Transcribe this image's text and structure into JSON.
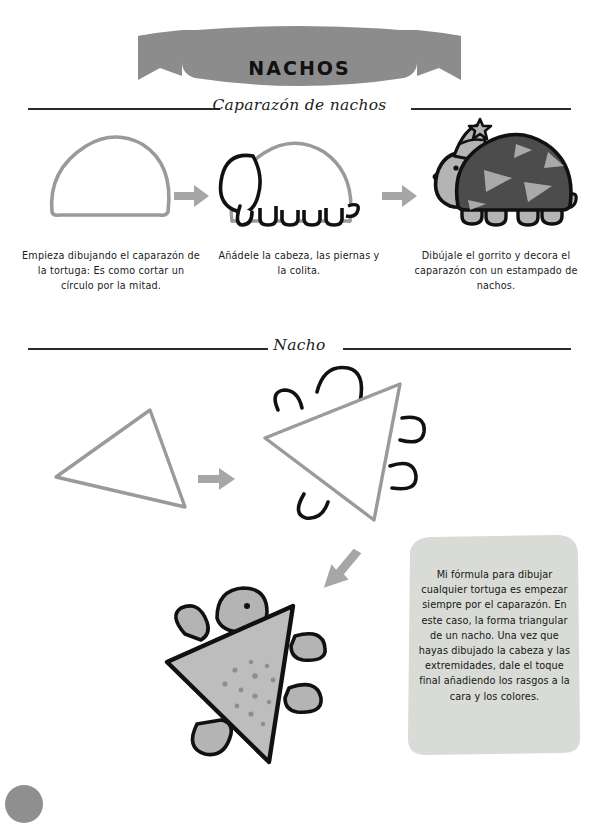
{
  "page": {
    "background_color": "#ffffff",
    "banner": {
      "title": "NACHOS",
      "fill_color": "#8c8c8c"
    },
    "corner_decoration": {
      "name": "page-corner-circle",
      "color": "#8f8f8f"
    }
  },
  "sections": [
    {
      "id": "caparazon",
      "title": "Caparazón de nachos",
      "steps": [
        {
          "index": 1,
          "caption": "Empieza dibujando el caparazón de la tortuga: Es como cortar un círculo por la mitad.",
          "figure": "turtle-shell-dome"
        },
        {
          "index": 2,
          "caption": "Añádele la cabeza, las piernas y la colita.",
          "figure": "turtle-outline-with-head-legs-tail"
        },
        {
          "index": 3,
          "caption": "Dibújale el gorrito y decora el caparazón con un estampado de nachos.",
          "figure": "turtle-colored-with-party-hat"
        }
      ]
    },
    {
      "id": "nacho",
      "title": "Nacho",
      "steps": [
        {
          "index": 1,
          "caption": "",
          "figure": "nacho-triangle-outline"
        },
        {
          "index": 2,
          "caption": "",
          "figure": "nacho-triangle-with-limbs"
        },
        {
          "index": 3,
          "caption": "",
          "figure": "nacho-turtle-colored"
        }
      ]
    }
  ],
  "note": {
    "text": "Mi fórmula para dibujar cualquier tortuga es empezar siempre por el caparazón. En este caso, la forma triangular de un nacho. Una vez que hayas dibujado la cabeza y las extremidades, dale el toque final añadiendo los rasgos a la cara y los colores.",
    "background_color": "#d9dbd6"
  },
  "colors": {
    "ink_black": "#111111",
    "guide_gray": "#9a9a9a",
    "arrow_gray": "#a0a0a0",
    "shell_dark": "#4c4c4c",
    "shell_light": "#a9a9a9",
    "body_light": "#b4b4b4",
    "nacho_fill": "#bdbdbd",
    "speckle": "#8e8e8e"
  },
  "icons": {
    "arrow_right": "arrow-right-icon",
    "arrow_down_left": "arrow-down-left-icon",
    "star": "star-icon"
  }
}
